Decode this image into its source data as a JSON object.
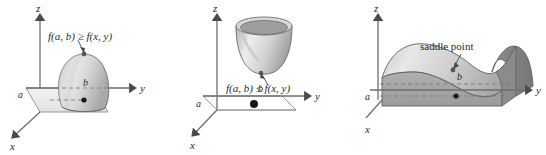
{
  "figure": {
    "panels": [
      {
        "id": "absolute-maximum",
        "surface_name": "dome-surface",
        "callout": "f(a, b) ≥ f(x, y)",
        "axes": {
          "z": "z",
          "y": "y",
          "x": "x"
        },
        "point_labels": {
          "b": "b",
          "a": "a"
        }
      },
      {
        "id": "absolute-minimum",
        "surface_name": "bowl-surface",
        "callout": "f(a, b) ≤ f(x, y)",
        "axes": {
          "z": "z",
          "y": "y",
          "x": "x"
        },
        "point_labels": {
          "b": "b",
          "a": "a"
        }
      },
      {
        "id": "saddle",
        "surface_name": "saddle-surface",
        "callout": "saddle point",
        "axes": {
          "z": "z",
          "y": "y",
          "x": "x"
        },
        "point_labels": {
          "b": "b",
          "a": "a"
        }
      }
    ]
  },
  "colors": {
    "background": "#ffffff",
    "ink": "#2b2b2b",
    "axis": "#6e6e6e",
    "surface_light": "#e3e3e3",
    "surface_mid": "#c9c9c9",
    "surface_dark": "#9a9a9a",
    "surface_edge": "#6b6b6b",
    "dashed": "#8a8a8a",
    "dot": "#1a1a1a"
  }
}
